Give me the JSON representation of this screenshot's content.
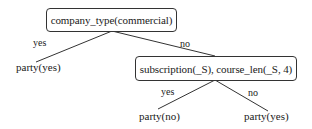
{
  "diagram": {
    "type": "decision-tree",
    "root": {
      "label": "company_type(commercial)",
      "yes_label": "yes",
      "no_label": "no",
      "yes_child": {
        "label": "party(yes)"
      },
      "no_child": {
        "label": "subscription(_S), course_len(_S, 4)",
        "yes_label": "yes",
        "no_label": "no",
        "yes_child": {
          "label": "party(no)"
        },
        "no_child": {
          "label": "party(yes)"
        }
      }
    }
  },
  "colors": {
    "line": "#333333",
    "text": "#1a1a1a",
    "background": "#ffffff"
  }
}
